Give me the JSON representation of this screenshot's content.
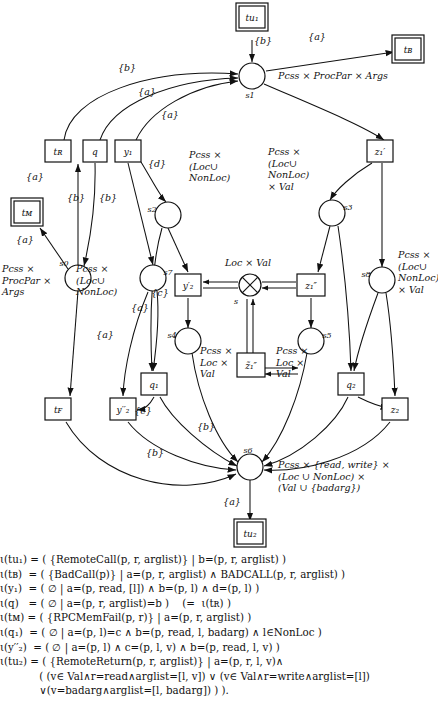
{
  "figure": {
    "kind": "petri-net-transition-diagram",
    "places": [
      {
        "id": "s1",
        "label": "s1",
        "x": 252,
        "y": 76,
        "type": "Pcss × ProcPar × Args",
        "type_x": 278,
        "type_y": 79,
        "lbl_dx": -2,
        "lbl_dy": 22
      },
      {
        "id": "s0",
        "label": "s0",
        "x": 78,
        "y": 278,
        "type": "Pcss ×\nProcPar ×\nArgs",
        "type_x": 2,
        "type_y": 272,
        "lbl_dx": -14,
        "lbl_dy": -12
      },
      {
        "id": "s7",
        "label": "s7",
        "x": 153,
        "y": 278,
        "type": "Pcss ×\n(Loc∪\nNonLoc)",
        "type_x": 76,
        "type_y": 272,
        "lbl_dx": 15,
        "lbl_dy": -3
      },
      {
        "id": "s2",
        "label": "s2",
        "x": 168,
        "y": 215,
        "type": "Pcss ×\n(Loc∪\nNonLoc)",
        "type_x": 189,
        "type_y": 158,
        "lbl_dx": -16,
        "lbl_dy": -3
      },
      {
        "id": "s3",
        "label": "s3",
        "x": 332,
        "y": 213,
        "type": "Pcss ×\n(Loc∪\nNonLoc)\n× Val",
        "type_x": 268,
        "type_y": 155,
        "lbl_dx": 16,
        "lbl_dy": -3
      },
      {
        "id": "s8",
        "label": "s8",
        "x": 382,
        "y": 280,
        "type": "Pcss ×\n(Loc∪\nNonLoc)\n× Val",
        "type_x": 398,
        "type_y": 258,
        "lbl_dx": -16,
        "lbl_dy": -3
      },
      {
        "id": "s4",
        "label": "s4",
        "x": 188,
        "y": 341,
        "type": "Pcss ×\nLoc ×\nVal",
        "type_x": 200,
        "type_y": 354,
        "lbl_dx": -16,
        "lbl_dy": -3
      },
      {
        "id": "s5",
        "label": "s5",
        "x": 311,
        "y": 341,
        "type": "Pcss ×\nLoc ×\nVal",
        "type_x": 276,
        "type_y": 354,
        "lbl_dx": 16,
        "lbl_dy": -3
      },
      {
        "id": "s6",
        "label": "s6",
        "x": 250,
        "y": 467,
        "type": "Pcss × {read, write} ×\n(Loc ∪ NonLoc) ×\n(Val ∪ {badarg})",
        "type_x": 278,
        "type_y": 468,
        "lbl_dx": -2,
        "lbl_dy": -14
      }
    ],
    "merge_node": {
      "id": "s",
      "label": "s",
      "x": 250,
      "y": 285,
      "type": "Loc × Val",
      "type_x": 225,
      "type_y": 266,
      "glyph": "⊗"
    },
    "boxes": [
      {
        "id": "tu1",
        "label": "tu₁",
        "x": 252,
        "y": 17,
        "double": true,
        "w": 26,
        "h": 22
      },
      {
        "id": "tB",
        "label": "tʙ",
        "x": 408,
        "y": 49,
        "double": true,
        "w": 26,
        "h": 22
      },
      {
        "id": "tM",
        "label": "tᴍ",
        "x": 27,
        "y": 212,
        "double": true,
        "w": 26,
        "h": 22
      },
      {
        "id": "tu2",
        "label": "tu₂",
        "x": 250,
        "y": 533,
        "double": true,
        "w": 26,
        "h": 22
      },
      {
        "id": "tR",
        "label": "tʀ",
        "x": 58,
        "y": 151,
        "double": false,
        "w": 26,
        "h": 22
      },
      {
        "id": "q",
        "label": "q",
        "x": 95,
        "y": 151,
        "double": false,
        "w": 24,
        "h": 22
      },
      {
        "id": "y1",
        "label": "y₁",
        "x": 128,
        "y": 151,
        "double": false,
        "w": 26,
        "h": 22
      },
      {
        "id": "z1p",
        "label": "z₁′",
        "x": 380,
        "y": 151,
        "double": false,
        "w": 26,
        "h": 22
      },
      {
        "id": "y2p",
        "label": "y′₂",
        "x": 188,
        "y": 285,
        "double": false,
        "w": 26,
        "h": 22
      },
      {
        "id": "z1pp",
        "label": "z₁″",
        "x": 311,
        "y": 285,
        "double": false,
        "w": 28,
        "h": 22
      },
      {
        "id": "z1ppt",
        "label": "z̃₁″",
        "x": 251,
        "y": 365,
        "double": false,
        "w": 28,
        "h": 24
      },
      {
        "id": "q1",
        "label": "q₁",
        "x": 154,
        "y": 384,
        "double": false,
        "w": 26,
        "h": 22
      },
      {
        "id": "q2",
        "label": "q₂",
        "x": 351,
        "y": 384,
        "double": false,
        "w": 26,
        "h": 22
      },
      {
        "id": "tF",
        "label": "tꜰ",
        "x": 58,
        "y": 409,
        "double": false,
        "w": 26,
        "h": 22
      },
      {
        "id": "y2pp",
        "label": "y′′₂",
        "x": 123,
        "y": 409,
        "double": false,
        "w": 26,
        "h": 22
      },
      {
        "id": "z2",
        "label": "z₂",
        "x": 395,
        "y": 409,
        "double": false,
        "w": 26,
        "h": 22
      }
    ],
    "edge_labels": [
      {
        "text": "{b}",
        "x": 263,
        "y": 44
      },
      {
        "text": "{a}",
        "x": 317,
        "y": 40
      },
      {
        "text": "{b}",
        "x": 127,
        "y": 71
      },
      {
        "text": "{a}",
        "x": 147,
        "y": 95
      },
      {
        "text": "{a}",
        "x": 170,
        "y": 118
      },
      {
        "text": "{d}",
        "x": 157,
        "y": 167
      },
      {
        "text": "{a}",
        "x": 35,
        "y": 180
      },
      {
        "text": "{b}",
        "x": 76,
        "y": 201
      },
      {
        "text": "{b}",
        "x": 108,
        "y": 201
      },
      {
        "text": "{a}",
        "x": 25,
        "y": 243
      },
      {
        "text": "{a}",
        "x": 140,
        "y": 311
      },
      {
        "text": "{a}",
        "x": 105,
        "y": 338
      },
      {
        "text": "{c}",
        "x": 160,
        "y": 296
      },
      {
        "text": "{c}",
        "x": 143,
        "y": 414
      },
      {
        "text": "{b}",
        "x": 206,
        "y": 430
      },
      {
        "text": "{b}",
        "x": 155,
        "y": 456
      },
      {
        "text": "{a}",
        "x": 232,
        "y": 505
      }
    ]
  },
  "formulas": [
    {
      "id": "tu1",
      "line": "ι(tu₁) = ( {RemoteCall(p, r, arglist)} | b=(p, r, arglist) )"
    },
    {
      "id": "tB",
      "line": "ι(tʙ)  = ( {BadCall(p)} | a=(p, r, arglist) ∧ BADCALL(p, r, arglist) )"
    },
    {
      "id": "y1",
      "line": "ι(y₁)  = ( ∅ | a=(p, read, [l]) ∧ b=(p, l) ∧ d=(p, l) )"
    },
    {
      "id": "q",
      "line": "ι(q)   = ( ∅ | a=(p, r, arglist)=b )    (=  ι(tʀ) )"
    },
    {
      "id": "tM",
      "line": "ι(tᴍ) = ( {RPCMemFail(p, r)} | a=(p, r, arglist) )"
    },
    {
      "id": "q1",
      "line": "ι(q₁)  = ( ∅ | a=(p, l)=c ∧ b=(p, read, l, badarg) ∧ l∈NonLoc )"
    },
    {
      "id": "y2pp",
      "line": "ι(y′′₂)  = ( ∅ | a=(p, l) ∧ c=(p, l, v) ∧ b=(p, read, l, v) )"
    },
    {
      "id": "tu2a",
      "line": "ι(tu₂) = ( {RemoteReturn(p, r, arglist)} | a=(p, r, l, v)∧"
    },
    {
      "id": "tu2b",
      "line": "            ( (v∈ Val∧r=read∧arglist=[l, v]) ∨ (v∈ Val∧r=write∧arglist=[l])"
    },
    {
      "id": "tu2c",
      "line": "            ∨(v=badarg∧arglist=[l, badarg]) ) )."
    }
  ]
}
